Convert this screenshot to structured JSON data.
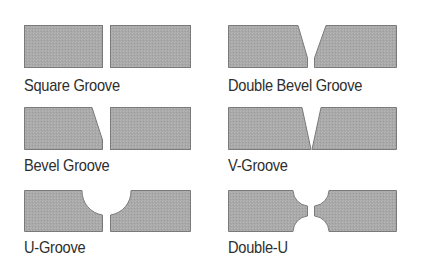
{
  "colors": {
    "fill": "#a8a8a8",
    "stroke": "#7a7a7a",
    "text": "#2e2e2e",
    "background": "#ffffff"
  },
  "joints": [
    {
      "id": "square-groove",
      "label": "Square Groove"
    },
    {
      "id": "double-bevel-groove",
      "label": "Double Bevel Groove"
    },
    {
      "id": "bevel-groove",
      "label": "Bevel Groove"
    },
    {
      "id": "v-groove",
      "label": "V-Groove"
    },
    {
      "id": "u-groove",
      "label": "U-Groove"
    },
    {
      "id": "double-u",
      "label": "Double-U"
    }
  ]
}
